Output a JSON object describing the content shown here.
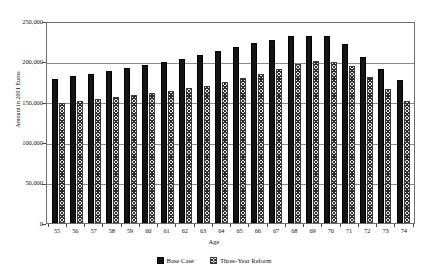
{
  "chart_data": {
    "type": "bar",
    "title": "",
    "xlabel": "Age",
    "ylabel": "Amount in 2001 Euros",
    "ylim": [
      0,
      250000
    ],
    "ytick_labels": [
      "250,000",
      "200,000",
      "150,000",
      "100,000",
      "50,000",
      "0"
    ],
    "ytick_values": [
      250000,
      200000,
      150000,
      100000,
      50000,
      0
    ],
    "grid": true,
    "legend_position": "bottom-center",
    "categories": [
      "55",
      "56",
      "57",
      "58",
      "59",
      "60",
      "61",
      "62",
      "63",
      "64",
      "65",
      "66",
      "67",
      "68",
      "69",
      "70",
      "71",
      "72",
      "73",
      "74"
    ],
    "series": [
      {
        "name": "Base Case",
        "color": "#141414",
        "values": [
          178000,
          182000,
          185000,
          188000,
          192000,
          196000,
          199000,
          203000,
          208000,
          213000,
          218000,
          223000,
          227000,
          231000,
          231000,
          232000,
          222000,
          206000,
          191000,
          177000
        ]
      },
      {
        "name": "Three-Year Reform",
        "color": "#f2f2f2",
        "values": [
          148000,
          151000,
          153000,
          156000,
          159000,
          161000,
          164000,
          167000,
          170000,
          175000,
          180000,
          185000,
          191000,
          197000,
          200000,
          199000,
          194000,
          181000,
          166000,
          151000
        ]
      }
    ]
  },
  "legend": {
    "items": [
      {
        "label": "Base Case",
        "swatch": "solid-black-square"
      },
      {
        "label": "Three-Year Reform",
        "swatch": "hatched-square"
      }
    ]
  }
}
